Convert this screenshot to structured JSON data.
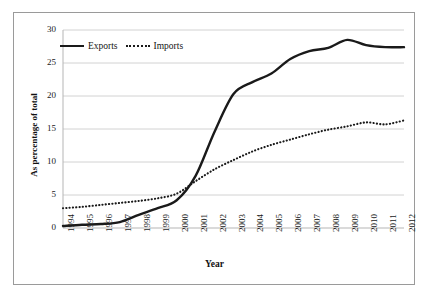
{
  "chart_data": {
    "type": "line",
    "title": "",
    "xlabel": "Year",
    "ylabel": "As percentage of total",
    "ylim": [
      0,
      30
    ],
    "yticks": [
      0,
      5,
      10,
      15,
      20,
      25,
      30
    ],
    "grid": "horizontal",
    "legend_position": "top-left-inside",
    "categories": [
      "1994",
      "1995",
      "1996",
      "1997",
      "1998",
      "1999",
      "2000",
      "2001",
      "2002",
      "2003",
      "2004",
      "2005",
      "2006",
      "2007",
      "2008",
      "2009",
      "2010",
      "2011",
      "2012"
    ],
    "series": [
      {
        "name": "Exports",
        "style": "solid",
        "color": "#1a1a1a",
        "values": [
          0.3,
          0.5,
          0.6,
          0.9,
          2.0,
          3.0,
          4.2,
          7.9,
          14.6,
          20.3,
          22.1,
          23.4,
          25.6,
          26.8,
          27.3,
          28.5,
          27.7,
          27.4,
          27.4
        ]
      },
      {
        "name": "Imports",
        "style": "dotted",
        "color": "#1a1a1a",
        "values": [
          3.0,
          3.2,
          3.5,
          3.8,
          4.1,
          4.5,
          5.2,
          7.1,
          8.9,
          10.3,
          11.6,
          12.6,
          13.4,
          14.2,
          14.9,
          15.4,
          16.0,
          15.7,
          16.3
        ]
      }
    ]
  },
  "legend": {
    "items": [
      {
        "label": "Exports",
        "style": "solid"
      },
      {
        "label": "Imports",
        "style": "dotted"
      }
    ]
  },
  "axes": {
    "x_title": "Year",
    "y_title": "As percentage of total"
  }
}
